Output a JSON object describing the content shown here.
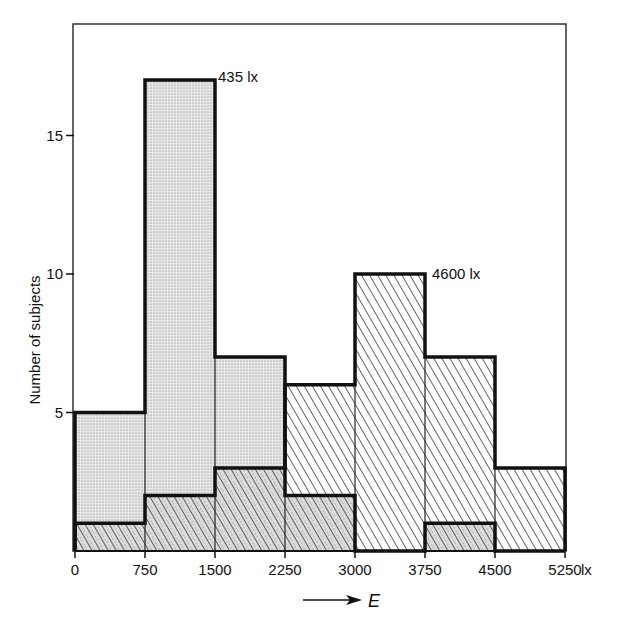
{
  "chart_data": {
    "type": "bar",
    "subtype": "overlapping histogram",
    "title": "",
    "xlabel": "E",
    "x_unit": "lx",
    "ylabel": "Number of subjects",
    "x_bin_edges": [
      0,
      750,
      1500,
      2250,
      3000,
      3750,
      4500,
      5250
    ],
    "categories": [
      "0-750",
      "750-1500",
      "1500-2250",
      "2250-3000",
      "3000-3750",
      "3750-4500",
      "4500-5250"
    ],
    "series": [
      {
        "name": "435 lx",
        "pattern": "dotted",
        "values": [
          5,
          17,
          7,
          2,
          0,
          1,
          0
        ]
      },
      {
        "name": "4600 lx",
        "pattern": "hatched",
        "values": [
          1,
          2,
          3,
          6,
          10,
          7,
          3
        ]
      }
    ],
    "ylim": [
      0,
      19
    ],
    "yticks": [
      5,
      10,
      15
    ],
    "xticks": [
      "0",
      "750",
      "1500",
      "2250",
      "3000",
      "3750",
      "4500",
      "5250"
    ],
    "annotations": [
      {
        "text": "435 lx",
        "near_bin": "750-1500"
      },
      {
        "text": "4600 lx",
        "near_bin": "3000-3750"
      }
    ],
    "grid": false,
    "legend": "none (direct labels)"
  },
  "labels": {
    "y_axis": "Number of subjects",
    "x_var": "E",
    "x_unit": "lx",
    "annot_435": "435 lx",
    "annot_4600": "4600 lx"
  }
}
